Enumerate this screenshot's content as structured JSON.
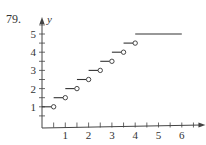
{
  "problem_number": "79.",
  "chart_data": {
    "type": "line",
    "title": "",
    "xlabel": "x",
    "ylabel": "y",
    "xlim": [
      0,
      6.5
    ],
    "ylim": [
      0,
      5.5
    ],
    "grid": false,
    "x_ticks": [
      1,
      2,
      3,
      4,
      5,
      6
    ],
    "y_ticks": [
      1,
      2,
      3,
      4,
      5
    ],
    "segments": [
      {
        "x_start": 0,
        "x_end": 0.5,
        "y": 1,
        "left": "closed",
        "right": "open"
      },
      {
        "x_start": 0.5,
        "x_end": 1,
        "y": 1.5,
        "left": "closed",
        "right": "open"
      },
      {
        "x_start": 1,
        "x_end": 1.5,
        "y": 2,
        "left": "closed",
        "right": "open"
      },
      {
        "x_start": 1.5,
        "x_end": 2,
        "y": 2.5,
        "left": "closed",
        "right": "open"
      },
      {
        "x_start": 2,
        "x_end": 2.5,
        "y": 3,
        "left": "closed",
        "right": "open"
      },
      {
        "x_start": 2.5,
        "x_end": 3,
        "y": 3.5,
        "left": "closed",
        "right": "open"
      },
      {
        "x_start": 3,
        "x_end": 3.5,
        "y": 4,
        "left": "closed",
        "right": "open"
      },
      {
        "x_start": 3.5,
        "x_end": 4,
        "y": 4.5,
        "left": "closed",
        "right": "open"
      },
      {
        "x_start": 4,
        "x_end": 6,
        "y": 5,
        "left": "closed",
        "right": "closed"
      }
    ]
  }
}
